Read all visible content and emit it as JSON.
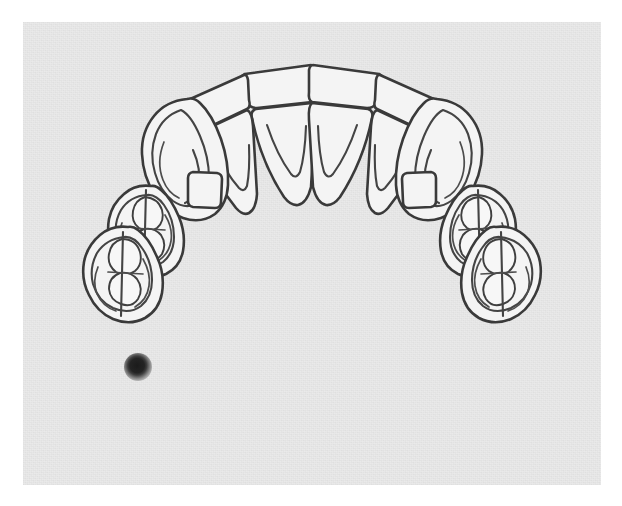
{
  "document": {
    "title": "Maxillary Dental Arch Diagram",
    "view": "occlusal",
    "medium": "hand-drawn line illustration on paper",
    "page_background": "#ffffff",
    "paper_background": "#eaeaea",
    "ink_color": "#3a3a3a"
  },
  "canvas": {
    "width": 622,
    "height": 506,
    "paper_left": 23,
    "paper_top": 22,
    "paper_width": 578,
    "paper_height": 463
  },
  "arch": {
    "name": "upper-dental-arch",
    "midline_x": 311,
    "tooth_count": 12,
    "symmetry": "bilateral",
    "teeth": [
      {
        "id": "central-incisor-left",
        "label": "Central incisor (left)",
        "quadrant": "left",
        "position": 1,
        "marking": "v-shaped lingual fossa"
      },
      {
        "id": "central-incisor-right",
        "label": "Central incisor (right)",
        "quadrant": "right",
        "position": 1,
        "marking": "v-shaped lingual fossa"
      },
      {
        "id": "lateral-incisor-left",
        "label": "Lateral incisor (left)",
        "quadrant": "left",
        "position": 2,
        "marking": "narrow v-shaped fossa"
      },
      {
        "id": "lateral-incisor-right",
        "label": "Lateral incisor (right)",
        "quadrant": "right",
        "position": 2,
        "marking": "narrow v-shaped fossa"
      },
      {
        "id": "canine-left",
        "label": "Canine (left)",
        "quadrant": "left",
        "position": 3,
        "marking": "cingulum with lingual ridge"
      },
      {
        "id": "canine-right",
        "label": "Canine (right)",
        "quadrant": "right",
        "position": 3,
        "marking": "cingulum with lingual ridge"
      },
      {
        "id": "first-premolar-left",
        "label": "First premolar (left)",
        "quadrant": "left",
        "position": 4,
        "marking": "two-cusp occlusal table"
      },
      {
        "id": "first-premolar-right",
        "label": "First premolar (right)",
        "quadrant": "right",
        "position": 4,
        "marking": "two-cusp occlusal table"
      },
      {
        "id": "second-premolar-left",
        "label": "Second premolar (left)",
        "quadrant": "left",
        "position": 5,
        "marking": "multi-cusp occlusal table"
      },
      {
        "id": "second-premolar-right",
        "label": "Second premolar (right)",
        "quadrant": "right",
        "position": 5,
        "marking": "multi-cusp occlusal table"
      }
    ]
  },
  "marker": {
    "name": "ink-dot-marker",
    "shape": "filled circle",
    "color": "#1b1b1b",
    "diameter_px": 28,
    "center_x": 115,
    "center_y": 345
  }
}
